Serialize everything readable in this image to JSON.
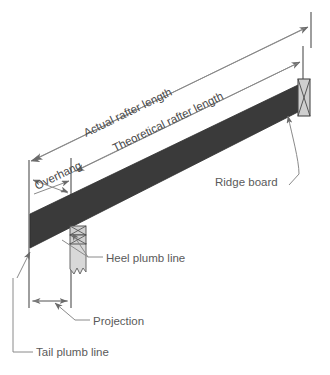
{
  "diagram": {
    "type": "technical-line-drawing",
    "background_color": "#ffffff",
    "line_color": "#6a6a6a",
    "text_color": "#545454",
    "rafter_color": "#3a3a3a",
    "member_fill_color": "#cfcfcf",
    "wall_fill_color": "#d8d8d8"
  },
  "labels": {
    "actual_rafter_length": "Actual rafter length",
    "theoretical_rafter_length": "Theoretical rafter length",
    "overhang": "Overhang",
    "ridge_board": "Ridge board",
    "heel_plumb_line": "Heel plumb line",
    "projection": "Projection",
    "tail_plumb_line": "Tail plumb line"
  },
  "parts": {
    "rafter": "rafter-board",
    "ridge_board": "ridge-board-member",
    "top_plate": "top-plate-blocks",
    "wall": "wall-stub",
    "break_symbol": "break-line-symbol"
  }
}
